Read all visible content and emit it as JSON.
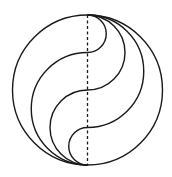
{
  "diagram": {
    "type": "geometric-construction",
    "colors": {
      "background": "#ffffff",
      "stroke": "#1a1a1a"
    },
    "circle": {
      "cx": 87.5,
      "cy": 90,
      "r": 75
    },
    "vertical_diameter": {
      "style": "dashed",
      "x": 87.5,
      "y1": 15,
      "y2": 165
    },
    "s_curves": [
      {
        "name": "s-curve-upper",
        "crosses_diameter_at_y": 52.5
      },
      {
        "name": "s-curve-middle",
        "crosses_diameter_at_y": 90
      },
      {
        "name": "s-curve-lower",
        "crosses_diameter_at_y": 127.5
      }
    ]
  }
}
